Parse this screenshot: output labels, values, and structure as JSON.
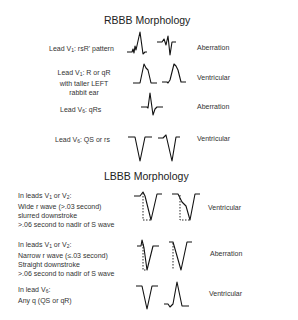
{
  "rbbb": {
    "title": "RBBB Morphology",
    "rows": [
      {
        "lead_prefix": "Lead V",
        "lead_sub": "1",
        "lead_suffix": ": rsR' pattern",
        "result": "Aberration"
      },
      {
        "lead_prefix": "Lead V",
        "lead_sub": "1",
        "lead_suffix": ": R or qR",
        "line2": "with taller LEFT",
        "line3": "rabbit ear",
        "result": "Ventricular"
      },
      {
        "lead_prefix": "Lead V",
        "lead_sub": "6",
        "lead_suffix": ": qRs",
        "result": "Aberration"
      },
      {
        "lead_prefix": "Lead V",
        "lead_sub": "6",
        "lead_suffix": ": QS or rs",
        "result": "Ventricular"
      }
    ]
  },
  "lbbb": {
    "title": "LBBB Morphology",
    "rows": [
      {
        "l1a": "In leads V",
        "l1s1": "1",
        "l1b": " or V",
        "l1s2": "2",
        "l1c": ":",
        "line2": "Wide r wave (>.03 second)",
        "line3": "slurred downstroke",
        "line4": ">.06 second to nadir of S wave",
        "result": "Ventricular"
      },
      {
        "l1a": "In leads V",
        "l1s1": "1",
        "l1b": " or V",
        "l1s2": "2",
        "l1c": ":",
        "line2": "Narrow r wave (≤.03 second)",
        "line3": "Straight downstroke",
        "line4": ">.06 second to nadir of S wave",
        "result": "Aberration"
      },
      {
        "l1a": "In lead V",
        "l1s1": "6",
        "l1c": ":",
        "line2": "Any q (QS or qR)",
        "result": "Ventricular"
      }
    ]
  }
}
